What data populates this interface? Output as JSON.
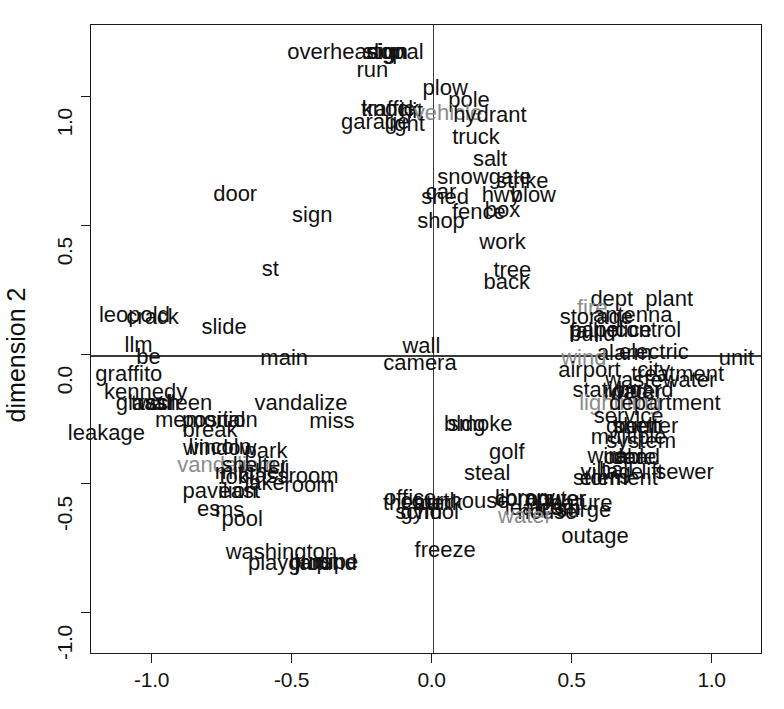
{
  "chart_data": {
    "type": "scatter",
    "title": "",
    "xlabel": "",
    "ylabel": "dimension 2",
    "xlim": [
      -1.22,
      1.18
    ],
    "ylim": [
      -1.16,
      1.28
    ],
    "xticks": [
      "-1.0",
      "-0.5",
      "0.0",
      "0.5",
      "1.0"
    ],
    "xtickvalues": [
      -1.0,
      -0.5,
      0.0,
      0.5,
      1.0
    ],
    "yticks": [
      "1.0",
      "0.5",
      "0.0",
      "-0.5",
      "-1.0"
    ],
    "ytickvalues": [
      1.0,
      0.5,
      0.0,
      -0.5,
      -1.0
    ],
    "grid": false,
    "reference_lines": {
      "vertical_at_x": 0.0,
      "horizontal_at_y": 0.0
    },
    "legend": "none",
    "point_marker": "text-label",
    "colors": {
      "primary": "#111111",
      "secondary": "#8c8c8c",
      "axis": "#1a1a1a"
    },
    "points": [
      {
        "label": "overhead",
        "x": -0.355,
        "y": 1.175,
        "color": "primary"
      },
      {
        "label": "stop",
        "x": -0.175,
        "y": 1.175,
        "color": "primary"
      },
      {
        "label": "signal",
        "x": -0.135,
        "y": 1.175,
        "color": "primary"
      },
      {
        "label": "sign",
        "x": -0.16,
        "y": 1.175,
        "color": "primary"
      },
      {
        "label": "run",
        "x": -0.215,
        "y": 1.105,
        "color": "primary"
      },
      {
        "label": "plow",
        "x": 0.045,
        "y": 1.035,
        "color": "primary"
      },
      {
        "label": "pole",
        "x": 0.13,
        "y": 0.99,
        "color": "primary"
      },
      {
        "label": "traffic",
        "x": -0.16,
        "y": 0.955,
        "color": "primary"
      },
      {
        "label": "knock",
        "x": -0.15,
        "y": 0.955,
        "color": "primary"
      },
      {
        "label": "hit",
        "x": -0.075,
        "y": 0.945,
        "color": "primary"
      },
      {
        "label": "vehicle",
        "x": 0.055,
        "y": 0.94,
        "color": "secondary"
      },
      {
        "label": "hydrant",
        "x": 0.205,
        "y": 0.93,
        "color": "primary"
      },
      {
        "label": "garage",
        "x": -0.205,
        "y": 0.905,
        "color": "primary"
      },
      {
        "label": "light",
        "x": -0.1,
        "y": 0.895,
        "color": "primary"
      },
      {
        "label": "truck",
        "x": 0.155,
        "y": 0.845,
        "color": "primary"
      },
      {
        "label": "salt",
        "x": 0.205,
        "y": 0.76,
        "color": "primary"
      },
      {
        "label": "snowgate",
        "x": 0.185,
        "y": 0.69,
        "color": "primary"
      },
      {
        "label": "strike",
        "x": 0.32,
        "y": 0.675,
        "color": "primary"
      },
      {
        "label": "door",
        "x": -0.705,
        "y": 0.625,
        "color": "primary"
      },
      {
        "label": "car",
        "x": 0.03,
        "y": 0.635,
        "color": "primary"
      },
      {
        "label": "shed",
        "x": 0.045,
        "y": 0.615,
        "color": "primary"
      },
      {
        "label": "hwy",
        "x": 0.245,
        "y": 0.62,
        "color": "primary"
      },
      {
        "label": "blow",
        "x": 0.36,
        "y": 0.62,
        "color": "primary"
      },
      {
        "label": "sign ",
        "x": -0.43,
        "y": 0.545,
        "color": "primary"
      },
      {
        "label": "fence",
        "x": 0.165,
        "y": 0.555,
        "color": "primary"
      },
      {
        "label": "box",
        "x": 0.25,
        "y": 0.565,
        "color": "primary"
      },
      {
        "label": "shop",
        "x": 0.03,
        "y": 0.52,
        "color": "primary"
      },
      {
        "label": "work",
        "x": 0.25,
        "y": 0.44,
        "color": "primary"
      },
      {
        "label": "tree",
        "x": 0.285,
        "y": 0.33,
        "color": "primary"
      },
      {
        "label": "st",
        "x": -0.58,
        "y": 0.335,
        "color": "primary"
      },
      {
        "label": "back",
        "x": 0.265,
        "y": 0.285,
        "color": "primary"
      },
      {
        "label": "dept",
        "x": 0.64,
        "y": 0.22,
        "color": "primary"
      },
      {
        "label": "plant",
        "x": 0.845,
        "y": 0.22,
        "color": "primary"
      },
      {
        "label": "fire",
        "x": 0.57,
        "y": 0.185,
        "color": "secondary"
      },
      {
        "label": "leopold",
        "x": -1.065,
        "y": 0.155,
        "color": "primary"
      },
      {
        "label": "crack",
        "x": -1.0,
        "y": 0.15,
        "color": "primary"
      },
      {
        "label": "storage",
        "x": 0.585,
        "y": 0.15,
        "color": "primary"
      },
      {
        "label": "antenna",
        "x": 0.715,
        "y": 0.155,
        "color": "primary"
      },
      {
        "label": "slide",
        "x": -0.745,
        "y": 0.11,
        "color": "primary"
      },
      {
        "label": "fall",
        "x": 0.54,
        "y": 0.095,
        "color": "primary"
      },
      {
        "label": "panel",
        "x": 0.585,
        "y": 0.1,
        "color": "primary"
      },
      {
        "label": "build",
        "x": 0.57,
        "y": 0.085,
        "color": "primary"
      },
      {
        "label": "police",
        "x": 0.68,
        "y": 0.1,
        "color": "primary"
      },
      {
        "label": "control",
        "x": 0.77,
        "y": 0.1,
        "color": "primary"
      },
      {
        "label": "llm",
        "x": -1.05,
        "y": 0.04,
        "color": "primary"
      },
      {
        "label": "wall",
        "x": -0.04,
        "y": 0.035,
        "color": "primary"
      },
      {
        "label": "alarm",
        "x": 0.685,
        "y": 0.01,
        "color": "primary"
      },
      {
        "label": "electric",
        "x": 0.79,
        "y": 0.015,
        "color": "primary"
      },
      {
        "label": "be",
        "x": -1.015,
        "y": -0.005,
        "color": "primary"
      },
      {
        "label": "main",
        "x": -0.53,
        "y": -0.01,
        "color": "primary"
      },
      {
        "label": "camera",
        "x": -0.045,
        "y": -0.03,
        "color": "primary"
      },
      {
        "label": "wind",
        "x": 0.54,
        "y": -0.01,
        "color": "secondary"
      },
      {
        "label": "unit",
        "x": 1.085,
        "y": -0.01,
        "color": "primary"
      },
      {
        "label": "graffito",
        "x": -1.085,
        "y": -0.07,
        "color": "primary"
      },
      {
        "label": "airport",
        "x": 0.56,
        "y": -0.055,
        "color": "primary"
      },
      {
        "label": "city",
        "x": 0.79,
        "y": -0.055,
        "color": "primary"
      },
      {
        "label": "treatment",
        "x": 0.875,
        "y": -0.07,
        "color": "primary"
      },
      {
        "label": "wastewater",
        "x": 0.815,
        "y": -0.095,
        "color": "primary"
      },
      {
        "label": "kennedy",
        "x": -1.025,
        "y": -0.14,
        "color": "primary"
      },
      {
        "label": "station",
        "x": 0.615,
        "y": -0.135,
        "color": "primary"
      },
      {
        "label": "board",
        "x": 0.76,
        "y": -0.135,
        "color": "primary"
      },
      {
        "label": "road",
        "x": 0.69,
        "y": -0.14,
        "color": "primary"
      },
      {
        "label": "water",
        "x": 0.725,
        "y": -0.14,
        "color": "primary"
      },
      {
        "label": "glass",
        "x": -1.04,
        "y": -0.185,
        "color": "primary"
      },
      {
        "label": "trash",
        "x": -0.99,
        "y": -0.185,
        "color": "primary"
      },
      {
        "label": "wall ",
        "x": -0.985,
        "y": -0.185,
        "color": "primary"
      },
      {
        "label": "screen",
        "x": -0.905,
        "y": -0.185,
        "color": "primary"
      },
      {
        "label": "vandalize",
        "x": -0.47,
        "y": -0.185,
        "color": "primary"
      },
      {
        "label": "lightning",
        "x": 0.67,
        "y": -0.185,
        "color": "secondary"
      },
      {
        "label": "department",
        "x": 0.83,
        "y": -0.185,
        "color": "primary"
      },
      {
        "label": "service",
        "x": 0.7,
        "y": -0.235,
        "color": "primary"
      },
      {
        "label": "memorial",
        "x": -0.83,
        "y": -0.25,
        "color": "primary"
      },
      {
        "label": "position",
        "x": -0.76,
        "y": -0.25,
        "color": "primary"
      },
      {
        "label": "miss",
        "x": -0.36,
        "y": -0.255,
        "color": "primary"
      },
      {
        "label": "bldg",
        "x": 0.115,
        "y": -0.265,
        "color": "primary"
      },
      {
        "label": "smoke",
        "x": 0.17,
        "y": -0.265,
        "color": "primary"
      },
      {
        "label": "green",
        "x": 0.72,
        "y": -0.275,
        "color": "primary"
      },
      {
        "label": "burn",
        "x": 0.725,
        "y": -0.275,
        "color": "primary"
      },
      {
        "label": "shelter ",
        "x": 0.76,
        "y": -0.275,
        "color": "primary"
      },
      {
        "label": "leakage",
        "x": -1.165,
        "y": -0.3,
        "color": "primary"
      },
      {
        "label": "break",
        "x": -0.795,
        "y": -0.29,
        "color": "primary"
      },
      {
        "label": "multiple",
        "x": 0.7,
        "y": -0.315,
        "color": "primary"
      },
      {
        "label": "system",
        "x": 0.745,
        "y": -0.33,
        "color": "primary"
      },
      {
        "label": "lincoln",
        "x": -0.76,
        "y": -0.355,
        "color": "primary"
      },
      {
        "label": "window",
        "x": -0.76,
        "y": -0.36,
        "color": "primary"
      },
      {
        "label": "park",
        "x": -0.595,
        "y": -0.37,
        "color": "primary"
      },
      {
        "label": "golf",
        "x": 0.265,
        "y": -0.375,
        "color": "primary"
      },
      {
        "label": "wire",
        "x": 0.625,
        "y": -0.39,
        "color": "primary"
      },
      {
        "label": "car ",
        "x": 0.7,
        "y": -0.395,
        "color": "primary"
      },
      {
        "label": "cable",
        "x": 0.705,
        "y": -0.395,
        "color": "primary"
      },
      {
        "label": "dead",
        "x": 0.725,
        "y": -0.395,
        "color": "primary"
      },
      {
        "label": "vandalism",
        "x": -0.735,
        "y": -0.425,
        "color": "secondary"
      },
      {
        "label": "shelter",
        "x": -0.635,
        "y": -0.425,
        "color": "primary"
      },
      {
        "label": "mitchell",
        "x": -0.645,
        "y": -0.45,
        "color": "primary"
      },
      {
        "label": "steal",
        "x": 0.195,
        "y": -0.455,
        "color": "primary"
      },
      {
        "label": "village",
        "x": 0.64,
        "y": -0.45,
        "color": "primary"
      },
      {
        "label": "hall",
        "x": 0.655,
        "y": -0.445,
        "color": "primary"
      },
      {
        "label": "lift",
        "x": 0.785,
        "y": -0.45,
        "color": "primary"
      },
      {
        "label": "sewer",
        "x": 0.9,
        "y": -0.45,
        "color": "primary"
      },
      {
        "label": "toki",
        "x": -0.7,
        "y": -0.47,
        "color": "primary"
      },
      {
        "label": "classroom",
        "x": -0.515,
        "y": -0.465,
        "color": "primary"
      },
      {
        "label": "storm",
        "x": 0.6,
        "y": -0.475,
        "color": "primary"
      },
      {
        "label": "element",
        "x": 0.665,
        "y": -0.475,
        "color": "primary"
      },
      {
        "label": "lake",
        "x": -0.6,
        "y": -0.495,
        "color": "primary"
      },
      {
        "label": "room",
        "x": -0.44,
        "y": -0.5,
        "color": "primary"
      },
      {
        "label": "pavilion",
        "x": -0.76,
        "y": -0.525,
        "color": "primary"
      },
      {
        "label": "east",
        "x": -0.69,
        "y": -0.525,
        "color": "primary"
      },
      {
        "label": "office",
        "x": -0.08,
        "y": -0.55,
        "color": "primary"
      },
      {
        "label": "library",
        "x": 0.33,
        "y": -0.55,
        "color": "primary"
      },
      {
        "label": "computer",
        "x": 0.385,
        "y": -0.555,
        "color": "primary"
      },
      {
        "label": "power",
        "x": 0.44,
        "y": -0.555,
        "color": "primary"
      },
      {
        "label": "courthouse",
        "x": 0.08,
        "y": -0.565,
        "color": "primary"
      },
      {
        "label": "theater",
        "x": -0.055,
        "y": -0.57,
        "color": "primary"
      },
      {
        "label": "trunk",
        "x": 0.02,
        "y": -0.57,
        "color": "primary"
      },
      {
        "label": "feature",
        "x": 0.52,
        "y": -0.57,
        "color": "primary"
      },
      {
        "label": "es",
        "x": -0.8,
        "y": -0.595,
        "color": "primary"
      },
      {
        "label": "ms",
        "x": -0.725,
        "y": -0.6,
        "color": "primary"
      },
      {
        "label": "gym",
        "x": -0.04,
        "y": -0.605,
        "color": "primary"
      },
      {
        "label": "school",
        "x": -0.02,
        "y": -0.605,
        "color": "primary"
      },
      {
        "label": "house",
        "x": 0.41,
        "y": -0.605,
        "color": "primary"
      },
      {
        "label": "leak",
        "x": 0.33,
        "y": -0.59,
        "color": "primary"
      },
      {
        "label": "ics",
        "x": 0.42,
        "y": -0.59,
        "color": "primary"
      },
      {
        "label": "com",
        "x": 0.455,
        "y": -0.59,
        "color": "primary"
      },
      {
        "label": "surge",
        "x": 0.54,
        "y": -0.6,
        "color": "primary"
      },
      {
        "label": "water ",
        "x": 0.33,
        "y": -0.62,
        "color": "secondary"
      },
      {
        "label": "pool",
        "x": -0.68,
        "y": -0.635,
        "color": "primary"
      },
      {
        "label": "outage",
        "x": 0.58,
        "y": -0.7,
        "color": "primary"
      },
      {
        "label": "washington",
        "x": -0.54,
        "y": -0.76,
        "color": "primary"
      },
      {
        "label": "freeze",
        "x": 0.045,
        "y": -0.755,
        "color": "primary"
      },
      {
        "label": "playground",
        "x": -0.465,
        "y": -0.805,
        "color": "primary"
      },
      {
        "label": "jam",
        "x": -0.43,
        "y": -0.805,
        "color": "primary"
      },
      {
        "label": "burst",
        "x": -0.425,
        "y": -0.8,
        "color": "primary"
      },
      {
        "label": "pipe",
        "x": -0.34,
        "y": -0.8,
        "color": "primary"
      }
    ]
  },
  "axes": {
    "title": "",
    "x_label": "",
    "y_label": "dimension 2",
    "x_tick_labels": [
      "-1.0",
      "-0.5",
      "0.0",
      "0.5",
      "1.0"
    ],
    "y_tick_labels": [
      "1.0",
      "0.5",
      "0.0",
      "-0.5",
      "-1.0"
    ]
  }
}
